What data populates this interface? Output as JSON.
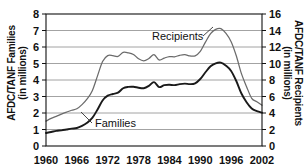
{
  "chart_data": {
    "type": "line",
    "title": "",
    "xlabel": "",
    "ylabel": "AFDC/TANF Families (in millions)",
    "ylabel_right": "AFDC/TANF Recipients (in millions)",
    "grid": true,
    "legend_position": "inline-annotations",
    "xlim": [
      1960,
      2002
    ],
    "xticks": [
      1960,
      1966,
      1972,
      1978,
      1984,
      1990,
      1996,
      2002
    ],
    "xtick_labels": [
      "1960",
      "1966",
      "1972",
      "1978",
      "1984",
      "1990",
      "1996",
      "2002"
    ],
    "ylim": [
      0,
      8
    ],
    "yticks": [
      0,
      1,
      2,
      3,
      4,
      5,
      6,
      7,
      8
    ],
    "ytick_labels": [
      "0",
      "1",
      "2",
      "3",
      "4",
      "5",
      "6",
      "7",
      "8"
    ],
    "ylim_right": [
      0,
      16
    ],
    "yticks_right": [
      0,
      2,
      4,
      6,
      8,
      10,
      12,
      14,
      16
    ],
    "ytick_labels_right": [
      "0",
      "2",
      "4",
      "6",
      "8",
      "10",
      "12",
      "14",
      "16"
    ],
    "x": [
      1960,
      1961,
      1962,
      1963,
      1964,
      1965,
      1966,
      1967,
      1968,
      1969,
      1970,
      1971,
      1972,
      1973,
      1974,
      1975,
      1976,
      1977,
      1978,
      1979,
      1980,
      1981,
      1982,
      1983,
      1984,
      1985,
      1986,
      1987,
      1988,
      1989,
      1990,
      1991,
      1992,
      1993,
      1994,
      1995,
      1996,
      1997,
      1998,
      1999,
      2000,
      2001,
      2002
    ],
    "series": [
      {
        "name": "Families",
        "axis": "left",
        "units": "millions",
        "color": "#1a1a1a",
        "values": [
          0.79,
          0.85,
          0.92,
          0.95,
          1.0,
          1.05,
          1.09,
          1.22,
          1.41,
          1.7,
          2.2,
          2.76,
          3.05,
          3.15,
          3.23,
          3.5,
          3.58,
          3.59,
          3.53,
          3.5,
          3.64,
          3.87,
          3.57,
          3.69,
          3.71,
          3.69,
          3.75,
          3.78,
          3.75,
          3.8,
          4.06,
          4.47,
          4.83,
          5.01,
          5.05,
          4.87,
          4.55,
          3.94,
          3.18,
          2.65,
          2.27,
          2.12,
          2.02
        ]
      },
      {
        "name": "Recipients",
        "axis": "right",
        "units": "millions",
        "color": "#6b6b6b",
        "values": [
          3.01,
          3.35,
          3.6,
          3.87,
          4.11,
          4.33,
          4.51,
          5.01,
          5.71,
          6.71,
          8.47,
          10.24,
          10.95,
          10.95,
          10.86,
          11.35,
          11.3,
          11.1,
          10.57,
          10.32,
          10.6,
          11.08,
          10.43,
          10.66,
          10.83,
          10.81,
          10.99,
          11.07,
          10.92,
          10.93,
          11.46,
          12.59,
          13.63,
          14.14,
          14.23,
          13.65,
          12.65,
          10.94,
          8.77,
          7.19,
          5.78,
          5.36,
          4.95
        ]
      }
    ],
    "annotations": [
      {
        "text": "Recipients",
        "series": "Recipients"
      },
      {
        "text": "Families",
        "series": "Families"
      }
    ]
  }
}
